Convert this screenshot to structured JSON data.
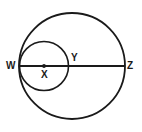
{
  "figure": {
    "kind": "geometry-diagram",
    "background_color": "#ffffff",
    "stroke_color": "#1a1a1a",
    "label_color": "#1a1a1a",
    "canvas": {
      "width": 142,
      "height": 132
    }
  },
  "shapes": {
    "large_circle": {
      "name": "large-circle",
      "center_x": 72,
      "center_y": 66,
      "radius": 53,
      "stroke_width": 1.8
    },
    "small_circle": {
      "name": "small-circle",
      "center_x": 44,
      "center_y": 66,
      "radius": 24.5,
      "stroke_width": 1.6
    },
    "diameter_line": {
      "name": "diameter-wz",
      "x1": 20,
      "y1": 66,
      "x2": 125,
      "y2": 66,
      "stroke_width": 2.2
    },
    "center_dot": {
      "name": "center-point-x",
      "cx": 44,
      "cy": 66,
      "r": 1.9
    }
  },
  "labels": {
    "w": "W",
    "x": "X",
    "y": "Y",
    "z": "Z"
  }
}
